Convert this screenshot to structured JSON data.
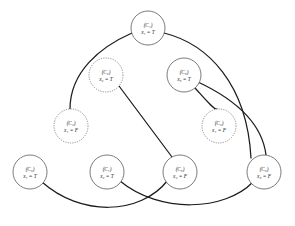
{
  "figure": {
    "type": "graph-diagram",
    "title": "",
    "background_color": "#ffffff",
    "edge_color": "#1c1c1c",
    "node_fill": "#ffffff",
    "node_stroke_solid": "#5a5a5a",
    "node_stroke_dotted": "#6a6a6a"
  },
  "nodes": [
    {
      "id": "n1",
      "clause": "(C",
      "clause_sub": "1",
      "clause_close": ")",
      "assign_var": "x",
      "assign_sub": "1",
      "assign_rel": "=",
      "assign_val": "T",
      "label_top": "(C₁)",
      "label_bottom": "x₁ = T",
      "cx": 148,
      "cy": 28,
      "r": 17,
      "border": "solid"
    },
    {
      "id": "n2",
      "clause": "(C",
      "clause_sub": "2",
      "clause_close": ")",
      "assign_var": "x",
      "assign_sub": "2",
      "assign_rel": "=",
      "assign_val": "T",
      "label_top": "(C₂)",
      "label_bottom": "x₂ = T",
      "cx": 106,
      "cy": 75,
      "r": 17,
      "border": "dotted"
    },
    {
      "id": "n3",
      "clause": "(C",
      "clause_sub": "3",
      "clause_close": ")",
      "assign_var": "x",
      "assign_sub": "3",
      "assign_rel": "=",
      "assign_val": "T",
      "label_top": "(C₃)",
      "label_bottom": "x₃ = T",
      "cx": 184,
      "cy": 75,
      "r": 17,
      "border": "solid"
    },
    {
      "id": "n4",
      "clause": "(C",
      "clause_sub": "4",
      "clause_close": ")",
      "assign_var": "x",
      "assign_sub": "1",
      "assign_rel": "=",
      "assign_val": "F",
      "label_top": "(C₄)",
      "label_bottom": "x₁ = F",
      "cx": 71,
      "cy": 126,
      "r": 17,
      "border": "dotted"
    },
    {
      "id": "n5",
      "clause": "(C",
      "clause_sub": "5",
      "clause_close": ")",
      "assign_var": "x",
      "assign_sub": "1",
      "assign_rel": "=",
      "assign_val": "F",
      "label_top": "(C₅)",
      "label_bottom": "x₁ = F",
      "cx": 219,
      "cy": 126,
      "r": 17,
      "border": "dotted"
    },
    {
      "id": "n6",
      "clause": "(C",
      "clause_sub": "6",
      "clause_close": ")",
      "assign_var": "x",
      "assign_sub": "1",
      "assign_rel": "=",
      "assign_val": "T",
      "label_top": "(C₆)",
      "label_bottom": "x₁ = T",
      "cx": 30,
      "cy": 172,
      "r": 17,
      "border": "solid"
    },
    {
      "id": "n7",
      "clause": "(C",
      "clause_sub": "7",
      "clause_close": ")",
      "assign_var": "x",
      "assign_sub": "2",
      "assign_rel": "=",
      "assign_val": "T",
      "label_top": "(C₇)",
      "label_bottom": "x₂ = T",
      "cx": 107,
      "cy": 172,
      "r": 17,
      "border": "solid"
    },
    {
      "id": "n8",
      "clause": "(C",
      "clause_sub": "8",
      "clause_close": ")",
      "assign_var": "x",
      "assign_sub": "2",
      "assign_rel": "=",
      "assign_val": "F",
      "label_top": "(C₈)",
      "label_bottom": "x₂ = F",
      "cx": 180,
      "cy": 172,
      "r": 17,
      "border": "solid"
    },
    {
      "id": "n9",
      "clause": "(C",
      "clause_sub": "9",
      "clause_close": ")",
      "assign_var": "x",
      "assign_sub": "3",
      "assign_rel": "=",
      "assign_val": "F",
      "label_top": "(C₉)",
      "label_bottom": "x₃ = F",
      "cx": 264,
      "cy": 172,
      "r": 17,
      "border": "solid"
    }
  ],
  "edges": [
    {
      "id": "e1",
      "from": "n1",
      "to": "n4",
      "path": "M 132 33 C 100 47 70 72 70 109"
    },
    {
      "id": "e2",
      "from": "n1",
      "to": "n9",
      "path": "M 164 33 C 208 44 247 84 251 158"
    },
    {
      "id": "e3",
      "from": "n2",
      "to": "n8",
      "path": "M 119 86 L 172 157"
    },
    {
      "id": "e4",
      "from": "n3",
      "to": "n5",
      "path": "M 195 88 C 205 99 214 110 217 109"
    },
    {
      "id": "e5",
      "from": "n3",
      "to": "n9",
      "path": "M 198 82 C 232 98 262 122 266 155"
    },
    {
      "id": "e6",
      "from": "n6",
      "to": "n8",
      "path": "M 42 182 C 80 216 140 216 168 180"
    },
    {
      "id": "e7",
      "from": "n7",
      "to": "n9",
      "path": "M 120 181 C 160 214 225 211 253 182"
    }
  ]
}
